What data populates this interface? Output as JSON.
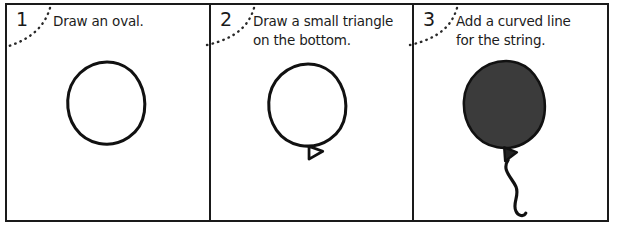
{
  "sheet": {
    "title": "How to draw a balloon - three step tutorial strip",
    "background_color": "#ffffff",
    "line_color": "#1a1a1a"
  },
  "panels": [
    {
      "number": "1",
      "instruction_lines": [
        "Draw an oval."
      ],
      "drawing": {
        "name": "oval-outline",
        "filled": false,
        "fill_color": "none",
        "stroke_color": "#111111",
        "has_triangle": false,
        "has_string": false
      }
    },
    {
      "number": "2",
      "instruction_lines": [
        "Draw a small triangle",
        "on the bottom."
      ],
      "drawing": {
        "name": "oval-with-triangle",
        "filled": false,
        "fill_color": "none",
        "stroke_color": "#111111",
        "has_triangle": true,
        "has_string": false
      }
    },
    {
      "number": "3",
      "instruction_lines": [
        "Add a curved line",
        "for the string."
      ],
      "drawing": {
        "name": "filled-balloon-with-string",
        "filled": true,
        "fill_color": "#3b3b3b",
        "stroke_color": "#111111",
        "has_triangle": true,
        "has_string": true
      }
    }
  ]
}
